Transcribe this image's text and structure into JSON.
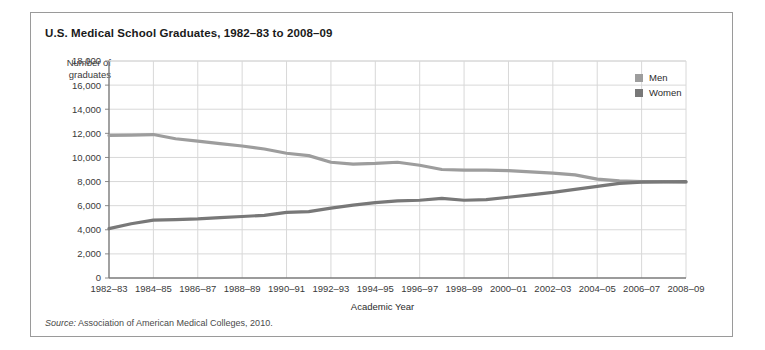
{
  "figure": {
    "title": "U.S. Medical School Graduates, 1982–83 to 2008–09",
    "ylabel_line1": "Number of",
    "ylabel_line2": "graduates",
    "xlabel": "Academic Year",
    "source_word": "Source:",
    "source_text": " Association of American Medical Colleges, 2010."
  },
  "legend": {
    "items": [
      {
        "label": "Men",
        "color": "#9d9d9d"
      },
      {
        "label": "Women",
        "color": "#787878"
      }
    ]
  },
  "chart_data": {
    "type": "line",
    "title": "U.S. Medical School Graduates, 1982–83 to 2008–09",
    "xlabel": "Academic Year",
    "ylabel": "Number of graduates",
    "ylim": [
      0,
      18000
    ],
    "ytick_step": 2000,
    "ytick_labels": [
      "0",
      "2,000",
      "4,000",
      "6,000",
      "8,000",
      "10,000",
      "12,000",
      "14,000",
      "16,000",
      "18,000"
    ],
    "grid": true,
    "legend_position": "top-right",
    "x": [
      "1982–83",
      "1983–84",
      "1984–85",
      "1985–86",
      "1986–87",
      "1987–88",
      "1988–89",
      "1989–90",
      "1990–91",
      "1991–92",
      "1992–93",
      "1993–94",
      "1994–95",
      "1995–96",
      "1996–97",
      "1997–98",
      "1998–99",
      "1999–00",
      "2000–01",
      "2001–02",
      "2002–03",
      "2003–04",
      "2004–05",
      "2005–06",
      "2006–07",
      "2007–08",
      "2008–09"
    ],
    "xtick_labels": [
      "1982–83",
      "1984–85",
      "1986–87",
      "1988–89",
      "1990–91",
      "1992–93",
      "1994–95",
      "1996–97",
      "1998–99",
      "2000–01",
      "2002–03",
      "2004–05",
      "2006–07",
      "2008–09"
    ],
    "xtick_indices": [
      0,
      2,
      4,
      6,
      8,
      10,
      12,
      14,
      16,
      18,
      20,
      22,
      24,
      26
    ],
    "series": [
      {
        "name": "Men",
        "color": "#9d9d9d",
        "values": [
          11830,
          11850,
          11900,
          11550,
          11350,
          11150,
          10950,
          10700,
          10350,
          10150,
          9600,
          9450,
          9500,
          9600,
          9350,
          9000,
          8950,
          8950,
          8900,
          8800,
          8700,
          8550,
          8200,
          8050,
          8000,
          8000,
          7950
        ]
      },
      {
        "name": "Women",
        "color": "#787878",
        "values": [
          4100,
          4500,
          4800,
          4850,
          4900,
          5000,
          5100,
          5200,
          5450,
          5500,
          5800,
          6050,
          6250,
          6400,
          6450,
          6600,
          6450,
          6500,
          6700,
          6900,
          7100,
          7350,
          7600,
          7850,
          7950,
          7980,
          8000
        ]
      }
    ]
  }
}
